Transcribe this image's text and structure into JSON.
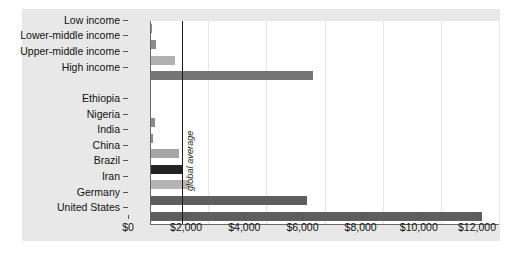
{
  "chart_data": {
    "type": "bar",
    "orientation": "horizontal",
    "title": "",
    "xlabel": "",
    "ylabel": "",
    "xlim": [
      0,
      12000
    ],
    "grid": true,
    "legend": false,
    "xticks": [
      {
        "value": 0,
        "label": "$0"
      },
      {
        "value": 2000,
        "label": "$2,000"
      },
      {
        "value": 4000,
        "label": "$4,000"
      },
      {
        "value": 6000,
        "label": "$6,000"
      },
      {
        "value": 8000,
        "label": "$8,000"
      },
      {
        "value": 10000,
        "label": "$10,000"
      },
      {
        "value": 12000,
        "label": "$12,000"
      }
    ],
    "categories": [
      "Low income",
      "Lower-middle income",
      "Upper-middle income",
      "High income",
      "",
      "Ethiopia",
      "Nigeria",
      "India",
      "China",
      "Brazil",
      "Iran",
      "Germany",
      "United States"
    ],
    "values": [
      60,
      190,
      850,
      5600,
      null,
      40,
      160,
      110,
      1000,
      1150,
      1350,
      5400,
      11400
    ],
    "bar_colors": [
      "#8c8c8c",
      "#8c8c8c",
      "#b0b0b0",
      "#757575",
      null,
      "#8c8c8c",
      "#8c8c8c",
      "#8c8c8c",
      "#a6a6a6",
      "#232323",
      "#b4b4b4",
      "#5e5e5e",
      "#5e5e5e"
    ],
    "annotations": [
      {
        "name": "global-average",
        "label": "global average",
        "value": 1100,
        "type": "vline"
      }
    ]
  },
  "colors": {
    "panel_background": "#e8e8e8",
    "plot_background": "#ffffff",
    "gridline": "#e4e4e4",
    "axis": "#6a6a6a",
    "text": "#111111",
    "annotation_line": "#1a1a1a"
  }
}
